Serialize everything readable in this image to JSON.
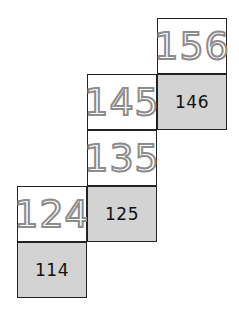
{
  "puzzle": {
    "cells": [
      {
        "value": "156",
        "style": "tracing",
        "col": 2,
        "row": 0
      },
      {
        "value": "145",
        "style": "tracing",
        "col": 1,
        "row": 1
      },
      {
        "value": "146",
        "style": "given",
        "col": 2,
        "row": 1
      },
      {
        "value": "135",
        "style": "tracing",
        "col": 1,
        "row": 2
      },
      {
        "value": "124",
        "style": "tracing",
        "col": 0,
        "row": 3
      },
      {
        "value": "125",
        "style": "given",
        "col": 1,
        "row": 3
      },
      {
        "value": "114",
        "style": "given",
        "col": 0,
        "row": 4
      }
    ],
    "colors": {
      "given_fill": "#d3d3d3",
      "tracing_text": "#8c8c8c",
      "border": "#222222"
    }
  }
}
